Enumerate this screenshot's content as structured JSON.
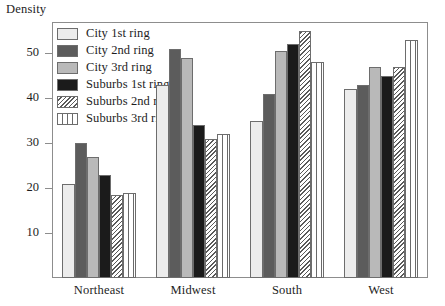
{
  "chart_data": {
    "type": "bar",
    "title": "",
    "xlabel": "",
    "ylabel": "Density",
    "ylim": [
      0,
      57
    ],
    "yticks": [
      10,
      20,
      30,
      40,
      50
    ],
    "grid": false,
    "legend_position": "top-left inside plot",
    "categories": [
      "Northeast",
      "Midwest",
      "South",
      "West"
    ],
    "series": [
      {
        "name": "City 1st ring",
        "pattern": "solid-very-light-gray",
        "color": "#ececec",
        "values": [
          21,
          43,
          35,
          42
        ]
      },
      {
        "name": "City 2nd ring",
        "pattern": "solid-dark-gray",
        "color": "#5c5c5c",
        "values": [
          30,
          51,
          41,
          43
        ]
      },
      {
        "name": "City 3rd ring",
        "pattern": "solid-light-gray",
        "color": "#b9b9b9",
        "values": [
          27,
          49,
          50.5,
          47
        ]
      },
      {
        "name": "Suburbs 1st ring",
        "pattern": "solid-black",
        "color": "#1b1b1b",
        "values": [
          23,
          34,
          52,
          45
        ]
      },
      {
        "name": "Suburbs 2nd ring",
        "pattern": "diagonal-hatch",
        "color": "#ffffff",
        "values": [
          18.5,
          31,
          55,
          47
        ]
      },
      {
        "name": "Suburbs 3rd ring",
        "pattern": "grid-hatch",
        "color": "#ffffff",
        "values": [
          19,
          32,
          48,
          53
        ]
      }
    ]
  },
  "axis": {
    "y_title": "Density",
    "tick_labels": [
      "50",
      "40",
      "30",
      "20",
      "10"
    ]
  },
  "colors": {
    "axis_line": "#8d8d8d",
    "bar_outline": "#6d6d6d",
    "text": "#1d1d1d",
    "background": "#ffffff"
  }
}
